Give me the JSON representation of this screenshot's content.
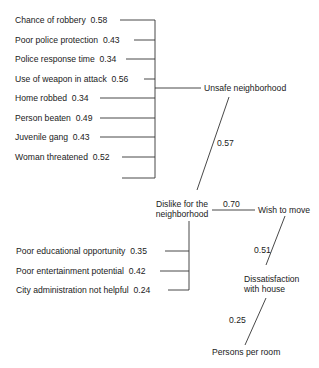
{
  "unsafe_group": {
    "items": [
      {
        "label": "Chance of robbery",
        "value": "0.58"
      },
      {
        "label": "Poor police protection",
        "value": "0.43"
      },
      {
        "label": "Police response time",
        "value": "0.34"
      },
      {
        "label": "Use of weapon in attack",
        "value": "0.56"
      },
      {
        "label": "Home robbed",
        "value": "0.34"
      },
      {
        "label": "Person beaten",
        "value": "0.49"
      },
      {
        "label": "Juvenile gang",
        "value": "0.43"
      },
      {
        "label": "Woman threatened",
        "value": "0.52"
      }
    ],
    "target": "Unsafe neighborhood"
  },
  "dislike_group": {
    "items": [
      {
        "label": "Poor educational opportunity",
        "value": "0.35"
      },
      {
        "label": "Poor entertainment potential",
        "value": "0.42"
      },
      {
        "label": "City administration not helpful",
        "value": "0.24"
      }
    ],
    "target_line1": "Dislike for the",
    "target_line2": "neighborhood"
  },
  "nodes": {
    "wish_to_move": "Wish to move",
    "dissatisfaction_line1": "Dissatisfaction",
    "dissatisfaction_line2": "with house",
    "persons_per_room": "Persons per room"
  },
  "paths": {
    "unsafe_to_dislike": "0.57",
    "dislike_to_wish": "0.70",
    "dissatisfaction_to_wish": "0.51",
    "persons_to_dissatisfaction": "0.25"
  }
}
